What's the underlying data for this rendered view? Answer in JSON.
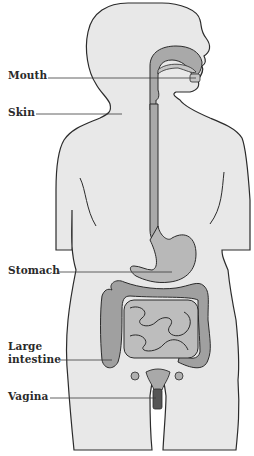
{
  "diagram": {
    "labels": [
      {
        "id": "mouth",
        "text": "Mouth"
      },
      {
        "id": "skin",
        "text": "Skin"
      },
      {
        "id": "stomach",
        "text": "Stomach"
      },
      {
        "id": "large_intestine_1",
        "text": "Large"
      },
      {
        "id": "large_intestine_2",
        "text": "intestine"
      },
      {
        "id": "vagina",
        "text": "Vagina"
      }
    ],
    "colors": {
      "body_fill": "#e8e8e8",
      "outline": "#2b2b2b",
      "organ_fill": "#a9a9a9",
      "organ_light": "#c6c6c6",
      "label_line": "#3a3a3a"
    }
  }
}
